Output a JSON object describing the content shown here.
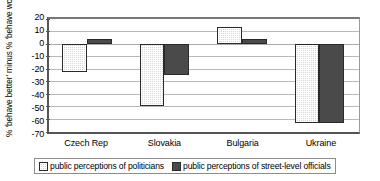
{
  "chart_data": {
    "type": "bar",
    "title": "",
    "subtitle": "",
    "xlabel": "",
    "ylabel": "% 'behave better' minus % 'behave worse'",
    "categories": [
      "Czech Rep",
      "Slovakia",
      "Bulgaria",
      "Ukraine"
    ],
    "series": [
      {
        "name": "public perceptions of politicians",
        "values": [
          -23,
          -50,
          13,
          -63
        ],
        "swatch": "light-checkered",
        "color": "#d6d6d6"
      },
      {
        "name": "public perceptions of street-level officials",
        "values": [
          4,
          -25,
          4,
          -63
        ],
        "swatch": "dark-solid",
        "color": "#4a4a4a"
      }
    ],
    "ylim": [
      -70,
      20
    ],
    "ytick_values": [
      20,
      10,
      0,
      -10,
      -20,
      -30,
      -40,
      -50,
      -60,
      -70
    ],
    "ytick_labels": [
      "20",
      "10",
      "0",
      "-10",
      "-20",
      "-30",
      "-40",
      "-50",
      "-60",
      "-70"
    ],
    "grid": true,
    "grid_axis": "y",
    "legend_position": "bottom",
    "orientation": "vertical",
    "bar_group_mode": "grouped"
  },
  "colors": {
    "axis": "#555555",
    "gridline": "#b9b9b9",
    "bar_light": "#d6d6d6",
    "bar_dark": "#4a4a4a",
    "bar_edge": "#2a2a2a",
    "text": "#000000",
    "legend_border": "#8d8d8d",
    "background": "#ffffff"
  }
}
